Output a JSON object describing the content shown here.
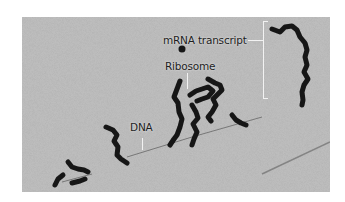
{
  "figure": {
    "type": "electron micrograph",
    "background_color": "#b9b9b9",
    "structure_color": "#1a1a1a"
  },
  "labels": {
    "mrna": "mRNA transcript",
    "ribosome": "Ribosome",
    "dna": "DNA"
  }
}
